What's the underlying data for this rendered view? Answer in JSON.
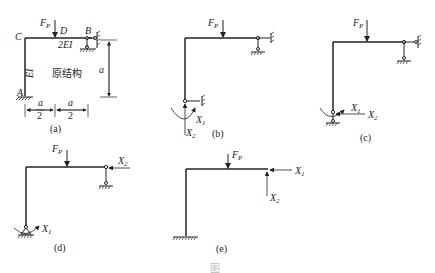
{
  "figure": {
    "caption": "图",
    "panels": [
      {
        "id": "a",
        "caption": "(a)",
        "labels": {
          "C": "C",
          "D": "D",
          "B": "B",
          "A": "A",
          "load": "F",
          "load_sub": "P",
          "beam_stiffness": "2EI",
          "column_stiffness": "EI",
          "title": "原结构",
          "height": "a",
          "half_span_1": "a",
          "half_span_2": "a",
          "denominator": "2"
        }
      },
      {
        "id": "b",
        "caption": "(b)",
        "labels": {
          "load": "F",
          "load_sub": "P",
          "x1": "X",
          "x1_sub": "1",
          "x2": "X",
          "x2_sub": "2"
        }
      },
      {
        "id": "c",
        "caption": "(c)",
        "labels": {
          "load": "F",
          "load_sub": "P",
          "x1": "X",
          "x1_sub": "1",
          "x2": "X",
          "x2_sub": "2"
        }
      },
      {
        "id": "d",
        "caption": "(d)",
        "labels": {
          "load": "F",
          "load_sub": "P",
          "x1": "X",
          "x1_sub": "1",
          "x2": "X",
          "x2_sub": "2"
        }
      },
      {
        "id": "e",
        "caption": "(e)",
        "labels": {
          "load": "F",
          "load_sub": "P",
          "x1": "X",
          "x1_sub": "1",
          "x2": "X",
          "x2_sub": "2"
        }
      }
    ]
  }
}
